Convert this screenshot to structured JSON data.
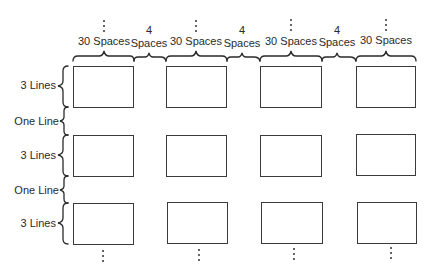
{
  "diagram": {
    "title": "",
    "columns": {
      "label_width": "30 Spaces",
      "label_gap_number": "4",
      "label_gap_unit": "Spaces",
      "count_visible": 4
    },
    "rows": {
      "label_height": "3 Lines",
      "label_gap": "One Line",
      "count_visible": 3
    },
    "top_labels": [
      {
        "text": "30 Spaces"
      },
      {
        "text": "4",
        "sub": "Spaces"
      },
      {
        "text": "30 Spaces"
      },
      {
        "text": "4",
        "sub": "Spaces"
      },
      {
        "text": "30 Spaces"
      },
      {
        "text": "4",
        "sub": "Spaces"
      },
      {
        "text": "30 Spaces"
      }
    ],
    "left_labels": [
      {
        "text": "3 Lines"
      },
      {
        "text": "One Line"
      },
      {
        "text": "3 Lines"
      },
      {
        "text": "One Line"
      },
      {
        "text": "3 Lines"
      }
    ],
    "continuation": "vertical ellipsis above each column and below each column",
    "colors": {
      "line": "#3a3a3a",
      "text": "#2a2a2a",
      "background": "#ffffff"
    }
  }
}
